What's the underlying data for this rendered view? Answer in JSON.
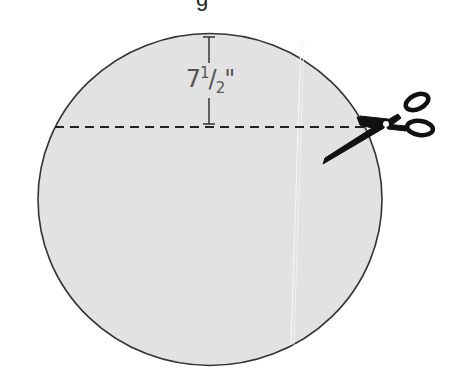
{
  "figure": {
    "title_fragment": "g",
    "shape": "circle",
    "fill_color": "#e2e2e2",
    "stroke_color": "#333333"
  },
  "dimension": {
    "whole": "7",
    "num": "1",
    "den": "2",
    "unit": "\""
  },
  "cut_line": {
    "style": "dashed",
    "color": "#222222"
  },
  "icons": {
    "cut_tool": "scissors-icon"
  }
}
